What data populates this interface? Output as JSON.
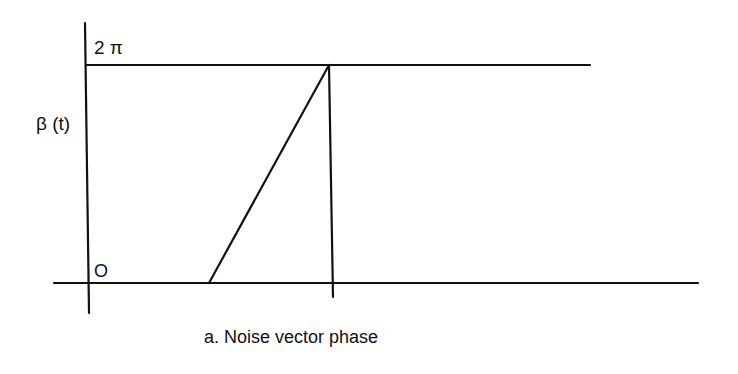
{
  "figure": {
    "caption": "a. Noise vector phase",
    "y_axis_label": "β (t)",
    "y_max_label": "2 π",
    "origin_label": "O",
    "line_color": "#111111",
    "background": "#ffffff"
  },
  "geometry": {
    "y_axis": {
      "x1": 85,
      "y1": 23,
      "x2": 89,
      "y2": 313
    },
    "top_level_line": {
      "x1": 86,
      "y1": 65,
      "x2": 590,
      "y2": 65
    },
    "baseline": {
      "x1": 54,
      "y1": 283,
      "x2": 698,
      "y2": 283
    },
    "ramp": {
      "x1": 209,
      "y1": 283,
      "x2": 329,
      "y2": 65
    },
    "vertical_drop": {
      "x1": 329,
      "y1": 65,
      "x2": 333,
      "y2": 297
    }
  }
}
